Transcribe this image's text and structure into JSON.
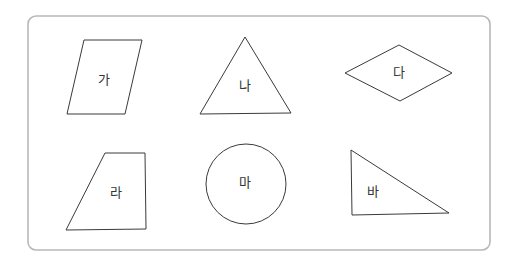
{
  "figure": {
    "frame": {
      "x": 28,
      "y": 16,
      "width": 462,
      "height": 234,
      "radius": 8,
      "stroke": "#b8b8b8"
    },
    "shapes": [
      {
        "id": "ga",
        "label": "가",
        "type": "parallelogram",
        "points": "84,40 142,40 125,114 67,114",
        "label_pos": [
          104,
          80
        ]
      },
      {
        "id": "na",
        "label": "나",
        "type": "triangle",
        "points": "245,37 291,113 200,114",
        "label_pos": [
          245,
          86
        ]
      },
      {
        "id": "da",
        "label": "다",
        "type": "rhombus",
        "points": "345,73 399,45 452,73 400,101",
        "label_pos": [
          399,
          73
        ]
      },
      {
        "id": "ra",
        "label": "라",
        "type": "trapezoid",
        "points": "105,153 145,153 146,229 66,230",
        "label_pos": [
          116,
          193
        ]
      },
      {
        "id": "ma",
        "label": "마",
        "type": "circle",
        "cx": 246,
        "cy": 184,
        "r": 40,
        "label_pos": [
          245,
          183
        ]
      },
      {
        "id": "ba",
        "label": "바",
        "type": "right-triangle",
        "points": "351,150 449,213 352,215",
        "label_pos": [
          373,
          192
        ]
      }
    ]
  }
}
